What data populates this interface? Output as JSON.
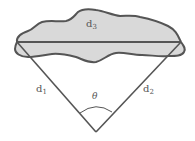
{
  "diagram": {
    "labels": {
      "d3": {
        "base": "d",
        "sub": "3"
      },
      "d1": {
        "base": "d",
        "sub": "1"
      },
      "d2": {
        "base": "d",
        "sub": "2"
      },
      "theta": "θ"
    },
    "colors": {
      "region_fill": "#d9d9d9",
      "stroke": "#555555",
      "label": "#555555"
    }
  }
}
